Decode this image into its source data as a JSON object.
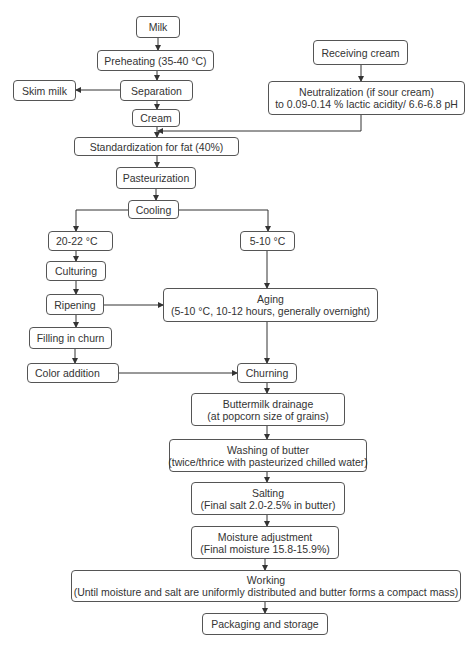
{
  "diagram": {
    "type": "flowchart",
    "nodes": {
      "milk": {
        "lines": [
          "Milk"
        ]
      },
      "preheating": {
        "lines": [
          "Preheating (35-40 °C)"
        ]
      },
      "separation": {
        "lines": [
          "Separation"
        ]
      },
      "skim_milk": {
        "lines": [
          "Skim milk"
        ]
      },
      "cream": {
        "lines": [
          "Cream"
        ]
      },
      "receiving_cream": {
        "lines": [
          "Receiving cream"
        ]
      },
      "neutralization": {
        "lines": [
          "Neutralization (if sour cream)",
          "to 0.09-0.14 % lactic acidity/ 6.6-6.8 pH"
        ]
      },
      "standardization": {
        "lines": [
          "Standardization for fat (40%)"
        ]
      },
      "pasteurization": {
        "lines": [
          "Pasteurization"
        ]
      },
      "cooling": {
        "lines": [
          "Cooling"
        ]
      },
      "temp_20_22": {
        "lines": [
          "20-22 °C"
        ]
      },
      "temp_5_10": {
        "lines": [
          "5-10 °C"
        ]
      },
      "culturing": {
        "lines": [
          "Culturing"
        ]
      },
      "ripening": {
        "lines": [
          "Ripening"
        ]
      },
      "aging": {
        "lines": [
          "Aging",
          "(5-10 °C, 10-12 hours, generally overnight)"
        ]
      },
      "filling": {
        "lines": [
          "Filling in churn"
        ]
      },
      "color_addition": {
        "lines": [
          "Color addition"
        ]
      },
      "churning": {
        "lines": [
          "Churning"
        ]
      },
      "buttermilk": {
        "lines": [
          "Buttermilk drainage",
          "(at popcorn size of grains)"
        ]
      },
      "washing": {
        "lines": [
          "Washing of butter",
          "(twice/thrice with pasteurized chilled water)"
        ]
      },
      "salting": {
        "lines": [
          "Salting",
          "(Final salt 2.0-2.5% in butter)"
        ]
      },
      "moisture": {
        "lines": [
          "Moisture adjustment",
          "(Final moisture 15.8-15.9%)"
        ]
      },
      "working": {
        "lines": [
          "Working",
          "(Until moisture and salt are uniformly distributed and butter forms a compact mass)"
        ]
      },
      "packaging": {
        "lines": [
          "Packaging and storage"
        ]
      }
    },
    "edges": [
      [
        "milk",
        "preheating"
      ],
      [
        "preheating",
        "separation"
      ],
      [
        "separation",
        "skim_milk"
      ],
      [
        "separation",
        "cream"
      ],
      [
        "receiving_cream",
        "neutralization"
      ],
      [
        "neutralization",
        "standardization"
      ],
      [
        "cream",
        "standardization"
      ],
      [
        "standardization",
        "pasteurization"
      ],
      [
        "pasteurization",
        "cooling"
      ],
      [
        "cooling",
        "temp_20_22"
      ],
      [
        "cooling",
        "temp_5_10"
      ],
      [
        "temp_20_22",
        "culturing"
      ],
      [
        "culturing",
        "ripening"
      ],
      [
        "ripening",
        "aging"
      ],
      [
        "temp_5_10",
        "aging"
      ],
      [
        "ripening",
        "filling"
      ],
      [
        "filling",
        "color_addition"
      ],
      [
        "color_addition",
        "churning"
      ],
      [
        "aging",
        "churning"
      ],
      [
        "churning",
        "buttermilk"
      ],
      [
        "buttermilk",
        "washing"
      ],
      [
        "washing",
        "salting"
      ],
      [
        "salting",
        "moisture"
      ],
      [
        "moisture",
        "working"
      ],
      [
        "working",
        "packaging"
      ]
    ]
  }
}
